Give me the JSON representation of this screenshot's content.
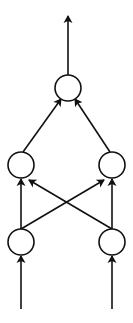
{
  "diagram": {
    "type": "feedforward-network",
    "stroke_color": "#111111",
    "background": "#ffffff",
    "nodes": [
      {
        "id": "output",
        "cx": 68,
        "cy": 88,
        "r": 13
      },
      {
        "id": "hidden-left",
        "cx": 21,
        "cy": 165,
        "r": 13
      },
      {
        "id": "hidden-right",
        "cx": 112,
        "cy": 165,
        "r": 13
      },
      {
        "id": "input-left",
        "cx": 21,
        "cy": 242,
        "r": 13
      },
      {
        "id": "input-right",
        "cx": 112,
        "cy": 242,
        "r": 13
      }
    ],
    "edges": [
      {
        "from": "hidden-left",
        "to": "output"
      },
      {
        "from": "hidden-right",
        "to": "output"
      },
      {
        "from": "input-left",
        "to": "hidden-left"
      },
      {
        "from": "input-left",
        "to": "hidden-right"
      },
      {
        "from": "input-right",
        "to": "hidden-left"
      },
      {
        "from": "input-right",
        "to": "hidden-right"
      }
    ],
    "external_inputs": 2,
    "external_outputs": 1
  }
}
